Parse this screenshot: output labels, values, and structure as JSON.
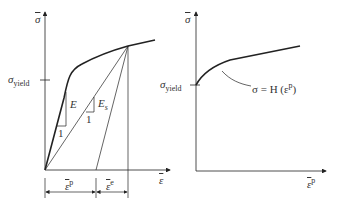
{
  "left_plot": {
    "y_axis_label": "σ",
    "x_axis_label": "ε",
    "yield_label": "σ",
    "yield_sub": "yield",
    "elastic_modulus": "E",
    "secant_modulus": "E",
    "secant_sub": "s",
    "slope_unit_1": "1",
    "slope_unit_2": "1",
    "plastic_strain": "ε",
    "plastic_sup": "p",
    "elastic_strain": "ε",
    "elastic_sup": "e"
  },
  "right_plot": {
    "y_axis_label": "σ",
    "x_axis_label": "ε",
    "x_axis_sup": "p",
    "yield_label": "σ",
    "yield_sub": "yield",
    "curve_label": "σ = H (ε",
    "curve_label_sup": "p",
    "curve_label_end": ")"
  },
  "colors": {
    "line": "#222222",
    "text": "#333333"
  }
}
